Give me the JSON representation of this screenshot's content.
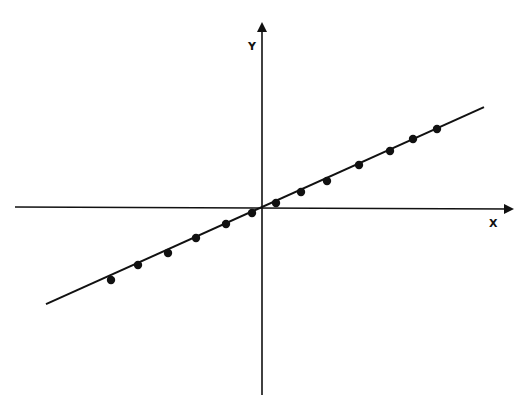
{
  "chart_data": {
    "type": "scatter",
    "title": "",
    "xlabel": "X",
    "ylabel": "Y",
    "grid": false,
    "legend": null,
    "ticks": false,
    "axes_style": "cartesian-crossing-at-origin-with-arrows",
    "fit_line": {
      "description": "straight line through origin fitted to points",
      "slope": 0.45,
      "intercept": 0,
      "x_range": [
        -21.6,
        22.2
      ]
    },
    "series": [
      {
        "name": "data points",
        "marker": "filled-circle",
        "x": [
          -15.1,
          -12.4,
          -9.4,
          -6.6,
          -3.6,
          -1.0,
          1.4,
          3.9,
          6.5,
          9.7,
          12.8,
          15.1,
          17.5
        ],
        "y": [
          -7.3,
          -5.8,
          -4.6,
          -3.1,
          -1.7,
          -0.6,
          0.4,
          1.5,
          2.6,
          4.2,
          5.6,
          6.8,
          7.8
        ]
      }
    ],
    "xlim": [
      -24.7,
      26.6
    ],
    "ylim": [
      -18.8,
      19.3
    ]
  },
  "labels": {
    "x_axis": "X",
    "y_axis": "Y"
  },
  "style": {
    "ink": "#111111",
    "background": "#ffffff"
  },
  "geometry": {
    "origin_px": [
      262,
      207
    ],
    "px_per_unit": 10
  }
}
